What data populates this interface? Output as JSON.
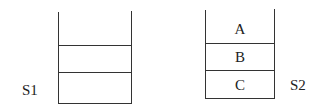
{
  "stacks": [
    {
      "name": "S1",
      "cells": [
        "",
        "",
        ""
      ]
    },
    {
      "name": "S2",
      "cells": [
        "A",
        "B",
        "C"
      ]
    }
  ],
  "colors": {
    "line": "#333333",
    "text": "#222222"
  }
}
